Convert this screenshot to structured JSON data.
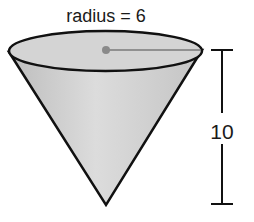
{
  "figure": {
    "shape": "cone",
    "orientation": "inverted",
    "radius_label": "radius = 6",
    "height_label": "10",
    "radius_value": 6,
    "height_value": 10
  },
  "colors": {
    "fill": "#d6d6d6",
    "stroke": "#111111",
    "radius_line": "#808080",
    "center_dot": "#8a8a8a"
  }
}
